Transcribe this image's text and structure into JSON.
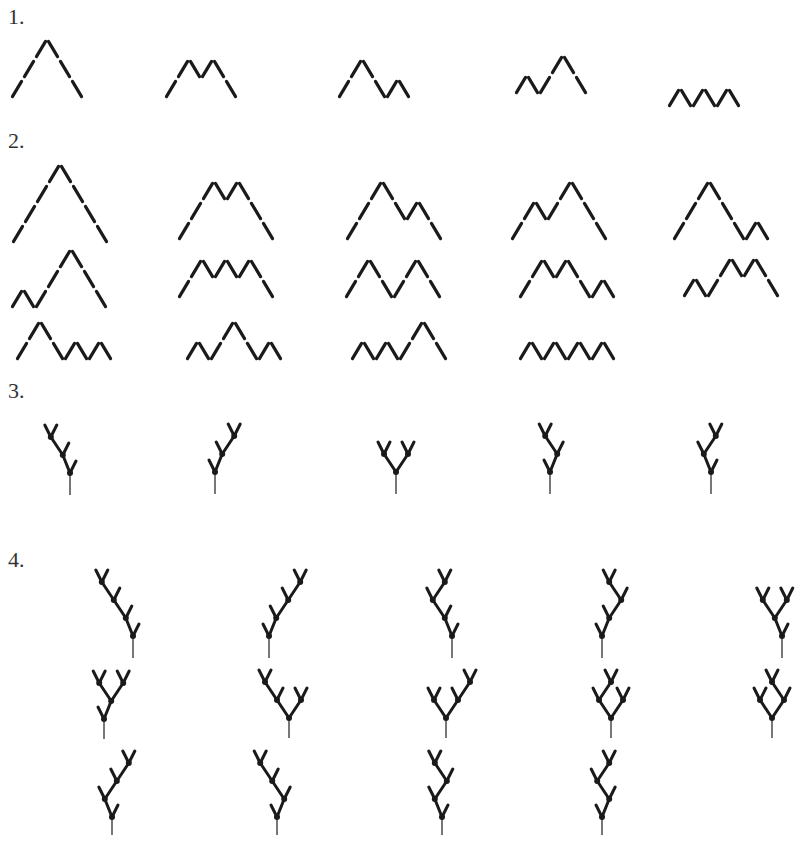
{
  "colors": {
    "ink": "#1a1a1a",
    "label": "#333333",
    "background": "#ffffff"
  },
  "sections": [
    {
      "label": "1.",
      "x": 8,
      "y": 6
    },
    {
      "label": "2.",
      "x": 8,
      "y": 130
    },
    {
      "label": "3.",
      "x": 8,
      "y": 380
    },
    {
      "label": "4.",
      "x": 8,
      "y": 549
    }
  ],
  "dyck_paths": {
    "step_dx": 12,
    "step_dy": 20,
    "section_1": [
      {
        "word": "UUUDDD",
        "x": 11,
        "y": 99
      },
      {
        "word": "UUDUDD",
        "x": 165,
        "y": 99
      },
      {
        "word": "UUDDUD",
        "x": 338,
        "y": 99
      },
      {
        "word": "UDUUDD",
        "x": 515,
        "y": 95
      },
      {
        "word": "UDUDUD",
        "x": 668,
        "y": 108
      }
    ],
    "section_2": [
      {
        "word": "UUUUDDDD",
        "x": 12,
        "y": 244
      },
      {
        "word": "UUUDUDDD",
        "x": 178,
        "y": 241
      },
      {
        "word": "UUUDDUDD",
        "x": 346,
        "y": 241
      },
      {
        "word": "UUDUUDDD",
        "x": 511,
        "y": 241
      },
      {
        "word": "UUUDDDUD",
        "x": 673,
        "y": 241
      },
      {
        "word": "UDUUUDDD",
        "x": 11,
        "y": 309
      },
      {
        "word": "UUDUDUDD",
        "x": 178,
        "y": 299
      },
      {
        "word": "UUDDUUDD",
        "x": 345,
        "y": 299
      },
      {
        "word": "UUDUDDUD",
        "x": 519,
        "y": 299
      },
      {
        "word": "UDUUDUDD",
        "x": 683,
        "y": 298
      },
      {
        "word": "UUDDUDUD",
        "x": 16,
        "y": 361
      },
      {
        "word": "UDUUDDUD",
        "x": 186,
        "y": 361
      },
      {
        "word": "UDUDUUDD",
        "x": 351,
        "y": 361
      },
      {
        "word": "UDUDUDUD",
        "x": 519,
        "y": 361
      }
    ]
  },
  "binary_trees": {
    "branch_dx": 6,
    "branch_dy": 12,
    "child_dx": 12,
    "child_dy": 18,
    "section_3": [
      {
        "shape": "LL",
        "x": 70,
        "y": 473,
        "stem": 22
      },
      {
        "shape": "RR",
        "x": 215,
        "y": 472,
        "stem": 22
      },
      {
        "shape": "B",
        "x": 396,
        "y": 472,
        "stem": 22
      },
      {
        "shape": "RL",
        "x": 550,
        "y": 472,
        "stem": 22
      },
      {
        "shape": "LR",
        "x": 711,
        "y": 472,
        "stem": 22
      }
    ],
    "section_4": [
      {
        "shape": "LLL",
        "x": 133,
        "y": 636,
        "stem": 22
      },
      {
        "shape": "RRR",
        "x": 269,
        "y": 636,
        "stem": 22
      },
      {
        "shape": "LLR",
        "x": 452,
        "y": 636,
        "stem": 22
      },
      {
        "shape": "RRL",
        "x": 602,
        "y": 636,
        "stem": 22
      },
      {
        "shape": "LB",
        "x": 782,
        "y": 636,
        "stem": 22
      },
      {
        "shape": "RB",
        "x": 104,
        "y": 719,
        "stem": 20
      },
      {
        "shape": "B_LL",
        "x": 289,
        "y": 718,
        "stem": 20
      },
      {
        "shape": "B_RR",
        "x": 446,
        "y": 718,
        "stem": 20
      },
      {
        "shape": "B_LR",
        "x": 611,
        "y": 718,
        "stem": 20
      },
      {
        "shape": "B_RL",
        "x": 772,
        "y": 718,
        "stem": 20
      },
      {
        "shape": "LRR",
        "x": 112,
        "y": 817,
        "stem": 18
      },
      {
        "shape": "RLL",
        "x": 277,
        "y": 817,
        "stem": 18
      },
      {
        "shape": "LRL",
        "x": 442,
        "y": 817,
        "stem": 18
      },
      {
        "shape": "RLR",
        "x": 602,
        "y": 817,
        "stem": 18
      }
    ]
  }
}
